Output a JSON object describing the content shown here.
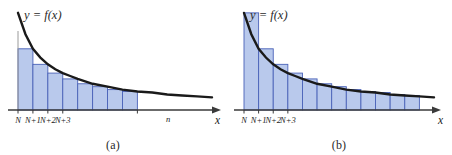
{
  "figure": {
    "background_color": "#ffffff",
    "bar_fill_color": "#b9c9ec",
    "bar_stroke_color": "#4a62b8",
    "curve_color": "#1a1a1a",
    "axis_color": "#3a3a3a",
    "guide_color": "#9a9a9a"
  },
  "panels": [
    {
      "id": "a",
      "caption": "(a)",
      "curve_label": "y = f(x)",
      "axis_label": "x",
      "tick_labels": [
        "N",
        "N+1",
        "N+2",
        "N+3"
      ],
      "end_tick_label": "n",
      "rectangle_rule": "right-endpoint",
      "rectangle_count": 8
    },
    {
      "id": "b",
      "caption": "(b)",
      "curve_label": "y = f(x)",
      "axis_label": "x",
      "tick_labels": [
        "N",
        "N+1",
        "N+2",
        "N+3"
      ],
      "end_tick_label": "",
      "rectangle_rule": "left-endpoint",
      "rectangle_count": 12
    }
  ],
  "chart_data": {
    "type": "area",
    "title": "",
    "subtitle": "",
    "xlabel": "x",
    "ylabel": "y = f(x)",
    "grid": false,
    "legend": "none",
    "curve": {
      "name": "y = f(x)",
      "form": "decreasing-convex",
      "x": [
        0,
        0.5,
        1,
        1.5,
        2,
        2.5,
        3,
        3.5,
        4,
        5,
        6,
        7,
        8,
        9,
        10,
        11,
        12,
        13
      ],
      "y": [
        1.0,
        0.78,
        0.63,
        0.54,
        0.47,
        0.42,
        0.38,
        0.35,
        0.32,
        0.27,
        0.24,
        0.21,
        0.19,
        0.18,
        0.16,
        0.15,
        0.14,
        0.13
      ]
    },
    "panel_a": {
      "type": "bar",
      "rule": "right-endpoint",
      "categories": [
        "N",
        "N+1",
        "N+2",
        "N+3",
        "N+4",
        "N+5",
        "N+6",
        "N+7"
      ],
      "values": [
        0.63,
        0.47,
        0.38,
        0.32,
        0.27,
        0.24,
        0.21,
        0.19
      ],
      "xlim": [
        0,
        13
      ],
      "ylim": [
        0,
        1.05
      ],
      "xticks": [
        "N",
        "N+1",
        "N+2",
        "N+3",
        "n"
      ]
    },
    "panel_b": {
      "type": "bar",
      "rule": "left-endpoint",
      "categories": [
        "N",
        "N+1",
        "N+2",
        "N+3",
        "N+4",
        "N+5",
        "N+6",
        "N+7",
        "N+8",
        "N+9",
        "N+10",
        "N+11"
      ],
      "values": [
        1.0,
        0.63,
        0.47,
        0.38,
        0.32,
        0.27,
        0.24,
        0.21,
        0.19,
        0.18,
        0.16,
        0.15
      ],
      "xlim": [
        0,
        13
      ],
      "ylim": [
        0,
        1.05
      ],
      "xticks": [
        "N",
        "N+1",
        "N+2",
        "N+3"
      ]
    }
  }
}
